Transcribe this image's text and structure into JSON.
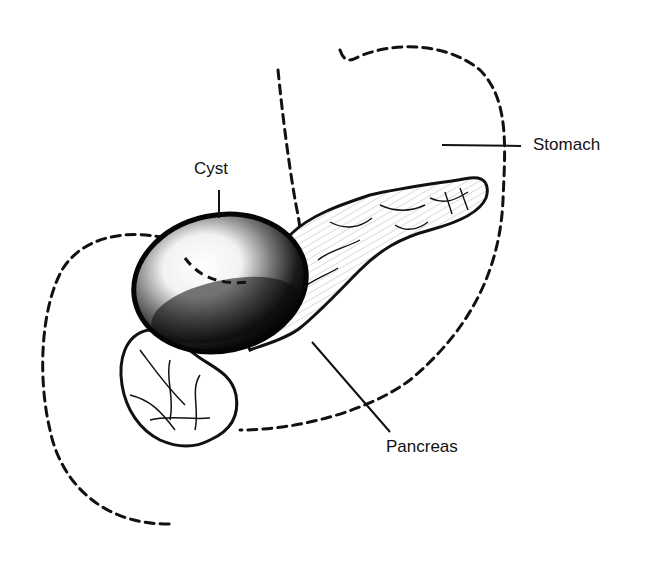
{
  "figure": {
    "type": "anatomical illustration",
    "style": "black-and-white pen drawing with dashed outlines",
    "colors": {
      "ink": "#111111",
      "background": "#ffffff"
    }
  },
  "labels": {
    "cyst": "Cyst",
    "stomach": "Stomach",
    "pancreas": "Pancreas"
  }
}
